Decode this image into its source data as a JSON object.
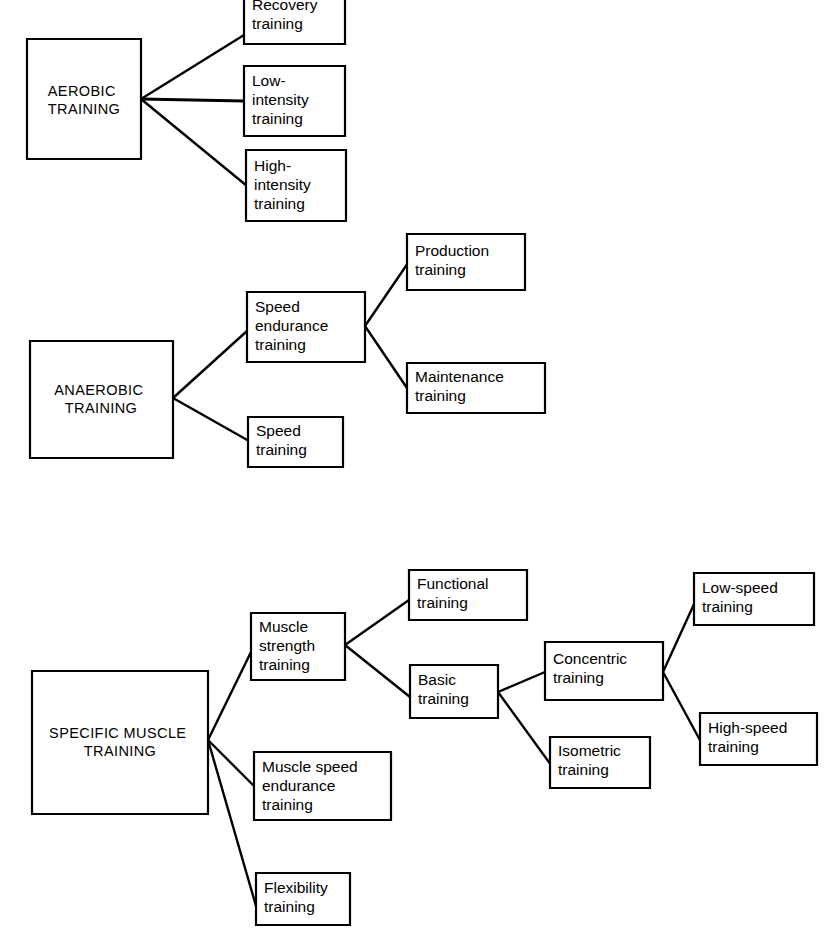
{
  "diagram": {
    "type": "tree-diagram",
    "background_color": "#ffffff",
    "line_color": "#000000",
    "box_fill": "#ffffff",
    "groups": [
      {
        "id": "aerobic",
        "root": {
          "id": "aerobic-training",
          "label": "AEROBIC TRAINING",
          "lines": [
            "AEROBIC",
            "TRAINING"
          ]
        },
        "children": [
          {
            "id": "recovery-training",
            "label": "Recovery training",
            "lines": [
              "Recovery",
              "training"
            ]
          },
          {
            "id": "low-intensity-training",
            "label": "Low-intensity training",
            "lines": [
              "Low-",
              "intensity",
              "training"
            ]
          },
          {
            "id": "high-intensity-training",
            "label": "High-intensity training",
            "lines": [
              "High-",
              "intensity",
              "training"
            ]
          }
        ]
      },
      {
        "id": "anaerobic",
        "root": {
          "id": "anaerobic-training",
          "label": "ANAEROBIC TRAINING",
          "lines": [
            "ANAEROBIC",
            "TRAINING"
          ]
        },
        "children": [
          {
            "id": "speed-endurance-training",
            "label": "Speed endurance training",
            "lines": [
              "Speed",
              "endurance",
              "training"
            ],
            "children": [
              {
                "id": "production-training",
                "label": "Production training",
                "lines": [
                  "Production",
                  "training"
                ]
              },
              {
                "id": "maintenance-training",
                "label": "Maintenance training",
                "lines": [
                  "Maintenance",
                  "training"
                ]
              }
            ]
          },
          {
            "id": "speed-training",
            "label": "Speed training",
            "lines": [
              "Speed",
              "training"
            ]
          }
        ]
      },
      {
        "id": "specific-muscle",
        "root": {
          "id": "specific-muscle-training",
          "label": "SPECIFIC MUSCLE TRAINING",
          "lines": [
            "SPECIFIC MUSCLE",
            "TRAINING"
          ]
        },
        "children": [
          {
            "id": "muscle-strength-training",
            "label": "Muscle strength training",
            "lines": [
              "Muscle",
              "strength",
              "training"
            ],
            "children": [
              {
                "id": "functional-training",
                "label": "Functional training",
                "lines": [
                  "Functional",
                  "training"
                ]
              },
              {
                "id": "basic-training",
                "label": "Basic training",
                "lines": [
                  "Basic",
                  "training"
                ],
                "children": [
                  {
                    "id": "concentric-training",
                    "label": "Concentric training",
                    "lines": [
                      "Concentric",
                      "training"
                    ],
                    "children": [
                      {
                        "id": "low-speed-training",
                        "label": "Low-speed training",
                        "lines": [
                          "Low-speed",
                          "training"
                        ]
                      },
                      {
                        "id": "high-speed-training",
                        "label": "High-speed training",
                        "lines": [
                          "High-speed",
                          "training"
                        ]
                      }
                    ]
                  },
                  {
                    "id": "isometric-training",
                    "label": "Isometric training",
                    "lines": [
                      "Isometric",
                      "training"
                    ]
                  }
                ]
              }
            ]
          },
          {
            "id": "muscle-speed-endurance-training",
            "label": "Muscle speed endurance training",
            "lines": [
              "Muscle speed",
              "endurance",
              "training"
            ]
          },
          {
            "id": "flexibility-training",
            "label": "Flexibility training",
            "lines": [
              "Flexibility",
              "training"
            ]
          }
        ]
      }
    ]
  },
  "labels": {
    "aerobic_training_l1": "AEROBIC",
    "aerobic_training_l2": "TRAINING",
    "recovery_l1": "Recovery",
    "recovery_l2": "training",
    "low_intensity_l1": "Low-",
    "low_intensity_l2": "intensity",
    "low_intensity_l3": "training",
    "high_intensity_l1": "High-",
    "high_intensity_l2": "intensity",
    "high_intensity_l3": "training",
    "anaerobic_training_l1": "ANAEROBIC",
    "anaerobic_training_l2": "TRAINING",
    "speed_endurance_l1": "Speed",
    "speed_endurance_l2": "endurance",
    "speed_endurance_l3": "training",
    "production_l1": "Production",
    "production_l2": "training",
    "maintenance_l1": "Maintenance",
    "maintenance_l2": "training",
    "speed_l1": "Speed",
    "speed_l2": "training",
    "specific_muscle_l1": "SPECIFIC MUSCLE",
    "specific_muscle_l2": "TRAINING",
    "muscle_strength_l1": "Muscle",
    "muscle_strength_l2": "strength",
    "muscle_strength_l3": "training",
    "functional_l1": "Functional",
    "functional_l2": "training",
    "basic_l1": "Basic",
    "basic_l2": "training",
    "concentric_l1": "Concentric",
    "concentric_l2": "training",
    "low_speed_l1": "Low-speed",
    "low_speed_l2": "training",
    "high_speed_l1": "High-speed",
    "high_speed_l2": "training",
    "isometric_l1": "Isometric",
    "isometric_l2": "training",
    "muscle_speed_endurance_l1": "Muscle speed",
    "muscle_speed_endurance_l2": "endurance",
    "muscle_speed_endurance_l3": "training",
    "flexibility_l1": "Flexibility",
    "flexibility_l2": "training"
  }
}
